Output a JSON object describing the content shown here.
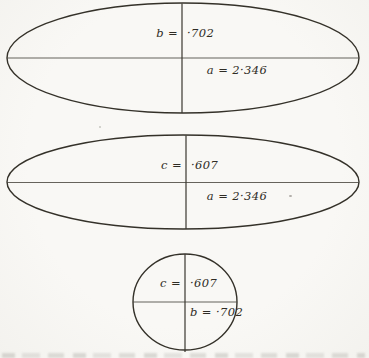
{
  "figures": [
    {
      "id": "upper-ellipse",
      "shape": "ellipse",
      "vertical_label": {
        "left": "b =",
        "right": "·702"
      },
      "horizontal_label": "a = 2·346"
    },
    {
      "id": "middle-ellipse",
      "shape": "ellipse",
      "vertical_label": {
        "left": "c =",
        "right": "·607"
      },
      "horizontal_label": "a = 2·346"
    },
    {
      "id": "lower-circle",
      "shape": "circle",
      "vertical_label": {
        "left": "c =",
        "right": "·607"
      },
      "horizontal_label": "b = ·702"
    }
  ],
  "dimensions": {
    "a": "2·346",
    "b": "·702",
    "c": "·607"
  },
  "colors": {
    "paper": "#f9f8f5",
    "ink": "#343129"
  }
}
